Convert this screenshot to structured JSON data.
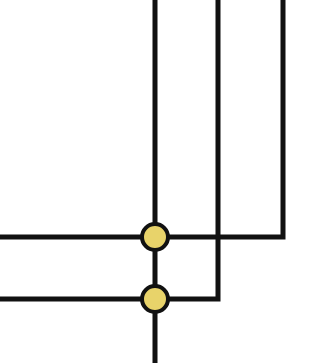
{
  "diagram": {
    "type": "circuit-junction-diagram",
    "background": "#ffffff",
    "line_color": "#111111",
    "line_width": 5,
    "junction_fill": "#E8D36A",
    "junction_stroke": "#111111",
    "junction_radius": 13,
    "junction_stroke_width": 4,
    "wires": [
      {
        "id": "wire-main-vertical",
        "points": [
          [
            155,
            0
          ],
          [
            155,
            363
          ]
        ]
      },
      {
        "id": "wire-upper",
        "points": [
          [
            0,
            237
          ],
          [
            283,
            237
          ],
          [
            283,
            0
          ]
        ]
      },
      {
        "id": "wire-lower",
        "points": [
          [
            0,
            299
          ],
          [
            218,
            299
          ],
          [
            218,
            0
          ]
        ]
      }
    ],
    "junctions": [
      {
        "id": "junction-upper",
        "cx": 155,
        "cy": 237
      },
      {
        "id": "junction-lower",
        "cx": 155,
        "cy": 299
      }
    ]
  }
}
